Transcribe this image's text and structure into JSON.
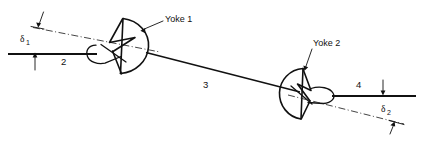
{
  "figure": {
    "labels": {
      "yoke1": "Yoke 1",
      "yoke2": "Yoke 2",
      "shaft2": "2",
      "shaft3": "3",
      "shaft4": "4",
      "delta": "δ",
      "delta1_sub": "1",
      "delta2_sub": "2"
    },
    "colors": {
      "ink": "#111111",
      "background": "#ffffff"
    },
    "geometry": {
      "input_shaft_y": 54,
      "input_shaft_x1": 8,
      "input_shaft_x2": 96,
      "output_shaft_y": 96,
      "output_shaft_x1": 337,
      "output_shaft_x2": 415,
      "joint1_center": [
        116,
        52
      ],
      "joint2_center": [
        300,
        98
      ],
      "intermediate_shaft_angle_deg": 14.2,
      "delta1_deg": 9,
      "delta2_deg": 10
    }
  }
}
